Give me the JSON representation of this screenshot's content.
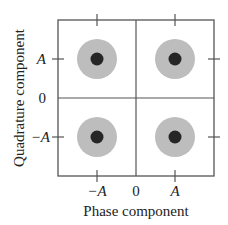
{
  "diagram": {
    "type": "constellation",
    "x_axis_label": "Phase component",
    "y_axis_label": "Quadrature component",
    "x_ticks": [
      {
        "label": "−A",
        "value": -1
      },
      {
        "label": "0",
        "value": 0
      },
      {
        "label": "A",
        "value": 1
      }
    ],
    "y_ticks": [
      {
        "label": "A",
        "value": 1
      },
      {
        "label": "0",
        "value": 0
      },
      {
        "label": "−A",
        "value": -1
      }
    ],
    "points": [
      {
        "x": -1,
        "y": 1
      },
      {
        "x": 1,
        "y": 1
      },
      {
        "x": -1,
        "y": -1
      },
      {
        "x": 1,
        "y": -1
      }
    ],
    "colors": {
      "noise_cloud": "#bdbdbd",
      "point": "#262626",
      "axis": "#555555"
    }
  }
}
